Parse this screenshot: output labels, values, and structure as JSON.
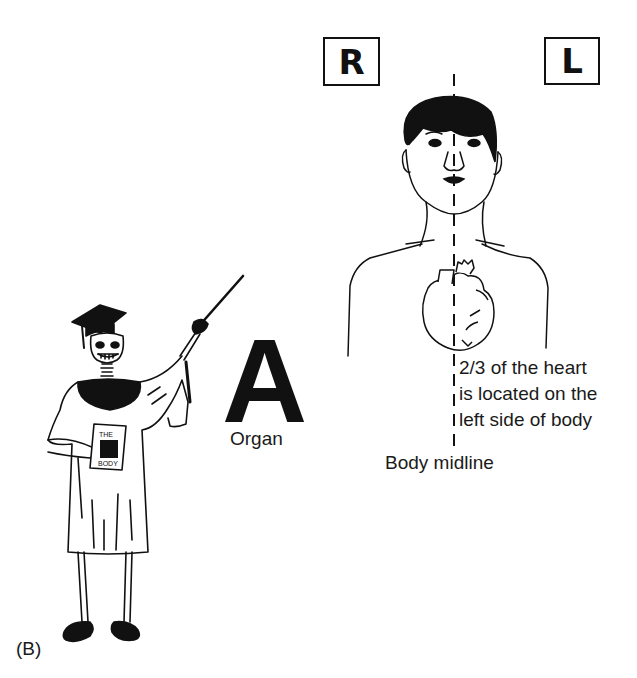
{
  "figure": {
    "panel_label": "(B)",
    "side_markers": {
      "right": "R",
      "left": "L"
    },
    "mnemonic_letter": "A",
    "mnemonic_word": "Organ",
    "annotation_lines": [
      "2/3 of the heart",
      "is located on the",
      "left side of body"
    ],
    "midline_label": "Body midline",
    "book_title": "THE BODY",
    "illustrations": {
      "skeleton_teacher": "skeleton in graduation cap and gown holding pointer and book",
      "torso": "front view of human head, neck and shoulders",
      "heart": "heart drawing offset to the left of the body midline"
    },
    "colors": {
      "ink": "#111111",
      "background": "#ffffff"
    }
  }
}
